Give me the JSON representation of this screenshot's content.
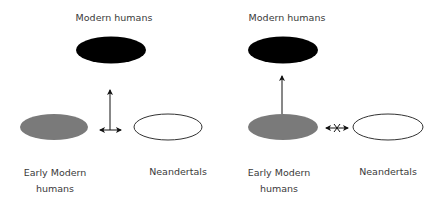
{
  "panels": [
    {
      "id": "left",
      "modern_humans": {
        "label": "Modern humans",
        "cx": 111,
        "cy": 50,
        "rx": 35,
        "ry": 13.5,
        "fill": "#000000",
        "label_x": 114,
        "label_y": 21
      },
      "early_modern": {
        "label_line1": "Early Modern",
        "label_line2": "humans",
        "cx": 54,
        "cy": 127,
        "rx": 34,
        "ry": 13,
        "fill": "#7a7a7a",
        "label_x": 55,
        "label_y1": 176,
        "label_y2": 192
      },
      "neandertals": {
        "label": "Neandertals",
        "cx": 168,
        "cy": 127,
        "rx": 34,
        "ry": 13,
        "fill": "#ffffff",
        "stroke": "#333333",
        "label_x": 178,
        "label_y": 175
      },
      "arrows": {
        "vertical": {
          "x": 110,
          "y1": 130,
          "y2": 90,
          "type": "single-up"
        },
        "horizontal": {
          "y": 130,
          "x1": 100,
          "x2": 121,
          "type": "double",
          "blocked": false
        }
      }
    },
    {
      "id": "right",
      "modern_humans": {
        "label": "Modern humans",
        "cx": 283,
        "cy": 50,
        "rx": 35,
        "ry": 13.5,
        "fill": "#000000",
        "label_x": 287,
        "label_y": 21
      },
      "early_modern": {
        "label_line1": "Early Modern",
        "label_line2": "humans",
        "cx": 283,
        "cy": 127,
        "rx": 35,
        "ry": 13,
        "fill": "#7a7a7a",
        "label_x": 279,
        "label_y1": 176,
        "label_y2": 192
      },
      "neandertals": {
        "label": "Neandertals",
        "cx": 388,
        "cy": 127,
        "rx": 35,
        "ry": 13,
        "fill": "#ffffff",
        "stroke": "#333333",
        "label_x": 388,
        "label_y": 175
      },
      "arrows": {
        "vertical": {
          "x": 282,
          "y1": 114,
          "y2": 76,
          "type": "single-up"
        },
        "horizontal": {
          "y": 128,
          "x1": 326,
          "x2": 348,
          "type": "double",
          "blocked": true,
          "block_mark": "X"
        }
      }
    }
  ],
  "colors": {
    "modern": "#000000",
    "early_modern": "#7a7a7a",
    "neandertal_fill": "#ffffff",
    "outline": "#333333",
    "text": "#3a3a3a",
    "arrow": "#111111"
  }
}
